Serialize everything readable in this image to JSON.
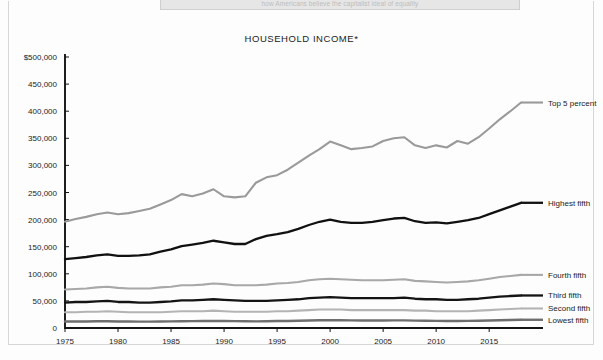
{
  "figure": {
    "title": "HOUSEHOLD INCOME*",
    "caption_fragment": "how Americans believe the capitalist ideal of equality"
  },
  "chart_data": {
    "type": "line",
    "title": "HOUSEHOLD INCOME*",
    "xlabel": "",
    "ylabel": "",
    "xlim": [
      1975,
      2018
    ],
    "ylim": [
      0,
      500000
    ],
    "grid": false,
    "legend_position": "right-inline-labels",
    "y_ticks": [
      "$500,000",
      "450,000",
      "400,000",
      "350,000",
      "300,000",
      "250,000",
      "200,000",
      "150,000",
      "100,000",
      "50,000",
      "0"
    ],
    "y_tick_values": [
      500000,
      450000,
      400000,
      350000,
      300000,
      250000,
      200000,
      150000,
      100000,
      50000,
      0
    ],
    "x_ticks": [
      "1975",
      "1980",
      "1985",
      "1990",
      "1995",
      "2000",
      "2005",
      "2010",
      "2015"
    ],
    "x_tick_values": [
      1975,
      1980,
      1985,
      1990,
      1995,
      2000,
      2005,
      2010,
      2015
    ],
    "x": [
      1975,
      1976,
      1977,
      1978,
      1979,
      1980,
      1981,
      1982,
      1983,
      1984,
      1985,
      1986,
      1987,
      1988,
      1989,
      1990,
      1991,
      1992,
      1993,
      1994,
      1995,
      1996,
      1997,
      1998,
      1999,
      2000,
      2001,
      2002,
      2003,
      2004,
      2005,
      2006,
      2007,
      2008,
      2009,
      2010,
      2011,
      2012,
      2013,
      2014,
      2015,
      2016,
      2017,
      2018
    ],
    "series": [
      {
        "name": "Top 5 percent",
        "color": "#9a9a9a",
        "width": 2.1,
        "label": "Top 5 percent",
        "values": [
          196000,
          201000,
          205000,
          210000,
          213000,
          210000,
          212000,
          216000,
          220000,
          228000,
          236000,
          247000,
          243000,
          248000,
          256000,
          243000,
          241000,
          243000,
          268000,
          278000,
          282000,
          292000,
          305000,
          318000,
          330000,
          344000,
          337000,
          330000,
          332000,
          335000,
          345000,
          350000,
          352000,
          337000,
          332000,
          337000,
          333000,
          345000,
          340000,
          352000,
          368000,
          385000,
          400000,
          416000
        ]
      },
      {
        "name": "Highest fifth",
        "color": "#111111",
        "width": 2.3,
        "label": "Highest fifth",
        "values": [
          127000,
          129000,
          131000,
          134000,
          136000,
          133000,
          133000,
          134000,
          136000,
          141000,
          145000,
          151000,
          154000,
          157000,
          161000,
          158000,
          155000,
          155000,
          164000,
          170000,
          173000,
          177000,
          183000,
          190000,
          196000,
          200000,
          196000,
          194000,
          194000,
          196000,
          199000,
          202000,
          203000,
          197000,
          194000,
          195000,
          193000,
          196000,
          199000,
          203000,
          210000,
          217000,
          224000,
          231000
        ]
      },
      {
        "name": "Fourth fifth",
        "color": "#a8a8a8",
        "width": 2.1,
        "label": "Fourth fifth",
        "values": [
          71000,
          72000,
          73000,
          75000,
          76000,
          74000,
          73000,
          73000,
          73000,
          75000,
          76000,
          79000,
          79000,
          80000,
          82000,
          81000,
          79000,
          79000,
          79000,
          80000,
          82000,
          83000,
          85000,
          88000,
          90000,
          91000,
          90000,
          89000,
          88000,
          88000,
          88000,
          89000,
          90000,
          87000,
          86000,
          85000,
          84000,
          85000,
          86000,
          88000,
          91000,
          94000,
          96000,
          98000
        ]
      },
      {
        "name": "Third fifth",
        "color": "#141414",
        "width": 2.3,
        "label": "Third fifth",
        "values": [
          47000,
          48000,
          48000,
          49000,
          50000,
          48000,
          48000,
          47000,
          47000,
          48000,
          49000,
          51000,
          51000,
          52000,
          53000,
          52000,
          51000,
          50000,
          50000,
          50000,
          51000,
          52000,
          53000,
          55000,
          56000,
          57000,
          56000,
          55000,
          55000,
          55000,
          55000,
          55000,
          56000,
          54000,
          53000,
          53000,
          52000,
          52000,
          53000,
          54000,
          56000,
          58000,
          59000,
          60000
        ]
      },
      {
        "name": "Second fifth",
        "color": "#b4b4b4",
        "width": 2.1,
        "label": "Second fifth",
        "values": [
          29000,
          29000,
          30000,
          30000,
          31000,
          30000,
          29000,
          29000,
          29000,
          29000,
          30000,
          31000,
          31000,
          31000,
          32000,
          31000,
          30000,
          30000,
          30000,
          30000,
          31000,
          31000,
          32000,
          33000,
          34000,
          34000,
          34000,
          33000,
          33000,
          33000,
          33000,
          33000,
          33000,
          32000,
          32000,
          31000,
          31000,
          31000,
          31000,
          32000,
          33000,
          34000,
          35000,
          36000
        ]
      },
      {
        "name": "Lowest fifth",
        "color": "#6e6e6e",
        "width": 2.4,
        "label": "Lowest fifth",
        "values": [
          12000,
          12000,
          12000,
          12500,
          12500,
          12000,
          12000,
          11800,
          11800,
          12000,
          12200,
          12500,
          12600,
          12800,
          13200,
          13000,
          12600,
          12500,
          12300,
          12400,
          12800,
          13000,
          13300,
          13800,
          14200,
          14400,
          14200,
          14000,
          13900,
          13900,
          13900,
          14000,
          14100,
          13600,
          13400,
          13200,
          13000,
          13000,
          13200,
          13400,
          13900,
          14400,
          14800,
          15200
        ]
      }
    ]
  }
}
